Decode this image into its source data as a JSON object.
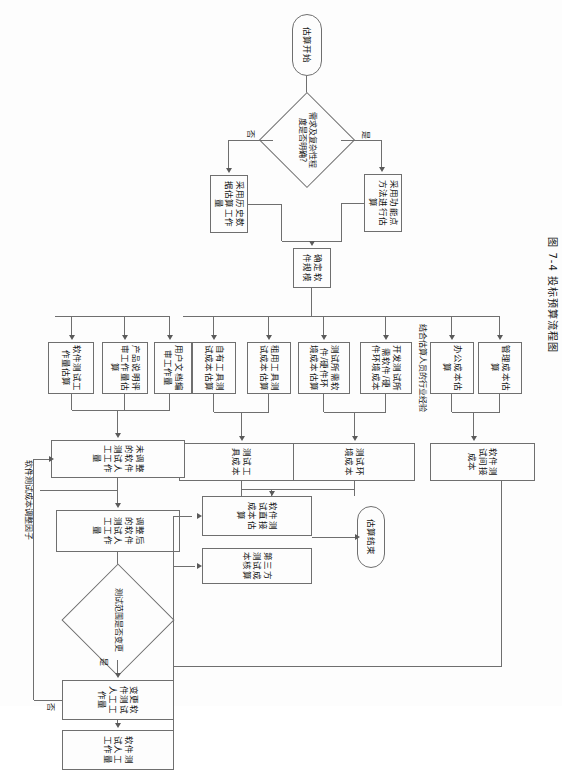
{
  "figure": {
    "caption": "图 7-4  投标预算流程图",
    "line_color": "#6f6f6f",
    "text_color": "#141414",
    "background": "#fdfdfd"
  },
  "nodes": {
    "start": "估算开始",
    "decision_requirements": "需求及复杂性程度是否明确?",
    "function_point_method": "采用功能点方法进行估算",
    "historical_data": "采用历史数据估算工作量",
    "determine_scale": "确定软件规模",
    "industry_experience_label": "结合估算人员的行业经验",
    "own_tool_cost": "自有工具测试成本估算",
    "rental_tool_cost": "租用工具测试成本估算",
    "env_hw_sw_cost": "测试所需软件/硬件环境成本估算",
    "dev_test_env_cost": "开发测试所需软件/硬件环境成本",
    "office_cost": "办公成本估算",
    "management_cost": "管理成本估算",
    "test_tool_cost": "测试工具成本",
    "test_env_cost": "测试环境成本",
    "indirect_cost": "软件测试间接成本",
    "test_design_effort": "软件测试工作量估算",
    "product_spec_review_effort": "产品说明评审工作量估算",
    "user_doc_effort": "用户文档编审工作量",
    "unadjusted_effort": "未调整的软件测试人工工作量",
    "adjust_factor_label": "软件测试成本调整因子",
    "adjusted_effort": "调整后的软件测试人工工作量",
    "decision_scope": "测试范围是否变更",
    "change_effort": "变更软件测试人工工作量",
    "manual_effort": "软件测试人工工作量",
    "direct_cost": "软件测试直接成本估算",
    "third_party_cost": "第三方测试成本核算",
    "end": "估算结束"
  },
  "edge_labels": {
    "yes_requirements": "是",
    "no_requirements": "否",
    "yes_scope": "是",
    "no_scope": "否"
  }
}
